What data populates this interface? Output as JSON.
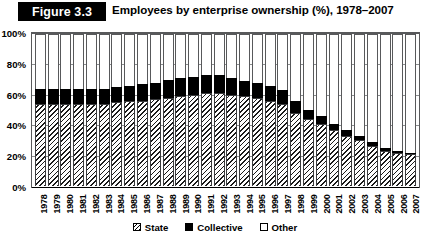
{
  "figure": {
    "badge_label": "Figure 3.3",
    "title": "Employees by enterprise ownership (%), 1978–2007"
  },
  "legend": {
    "items": [
      {
        "label": "State",
        "swatch": "hatched-swatch-icon",
        "color": "#000000"
      },
      {
        "label": "Collective",
        "swatch": "solid-black-swatch-icon",
        "color": "#000000"
      },
      {
        "label": "Other",
        "swatch": "white-swatch-icon",
        "color": "#ffffff"
      }
    ]
  },
  "axes": {
    "y_ticks": [
      "100%",
      "80%",
      "60%",
      "40%",
      "20%",
      "0%"
    ],
    "y_min": 0,
    "y_max": 100
  },
  "chart_data": {
    "type": "bar",
    "stacked": true,
    "title": "Employees by enterprise ownership (%), 1978–2007",
    "xlabel": "",
    "ylabel": "",
    "ylim": [
      0,
      100
    ],
    "ytick_labels": [
      "0%",
      "20%",
      "40%",
      "60%",
      "80%",
      "100%"
    ],
    "ytick_values": [
      0,
      20,
      40,
      60,
      80,
      100
    ],
    "grid": true,
    "legend_position": "bottom",
    "categories": [
      "1978",
      "1979",
      "1980",
      "1981",
      "1982",
      "1983",
      "1984",
      "1985",
      "1986",
      "1987",
      "1988",
      "1989",
      "1990",
      "1991",
      "1992",
      "1993",
      "1994",
      "1995",
      "1996",
      "1997",
      "1998",
      "1999",
      "2000",
      "2001",
      "2002",
      "2003",
      "2004",
      "2005",
      "2006",
      "2007"
    ],
    "series": [
      {
        "name": "State",
        "color": "#ffffff",
        "pattern": "diagonal-hatch",
        "values": [
          54,
          54,
          54,
          54,
          54,
          54,
          55,
          56,
          56,
          57,
          58,
          59,
          60,
          61,
          61,
          60,
          59,
          58,
          56,
          54,
          48,
          44,
          41,
          37,
          33,
          30,
          26,
          23,
          22,
          21
        ]
      },
      {
        "name": "Collective",
        "color": "#000000",
        "pattern": "solid",
        "values": [
          10,
          10,
          10,
          10,
          10,
          10,
          10,
          10,
          11,
          11,
          12,
          12,
          12,
          12,
          12,
          11,
          10,
          10,
          10,
          9,
          8,
          6,
          5,
          4,
          4,
          3,
          3,
          2,
          1,
          1
        ]
      },
      {
        "name": "Other",
        "color": "#ffffff",
        "pattern": "solid",
        "values": [
          36,
          36,
          36,
          36,
          36,
          36,
          35,
          34,
          33,
          32,
          30,
          29,
          28,
          27,
          27,
          29,
          31,
          32,
          34,
          37,
          44,
          50,
          54,
          59,
          63,
          67,
          71,
          75,
          77,
          78
        ]
      }
    ]
  }
}
